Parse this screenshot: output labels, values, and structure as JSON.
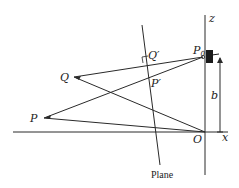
{
  "diagram": {
    "labels": {
      "z_axis": "z",
      "x_axis": "x",
      "origin": "O",
      "camera_point": "P",
      "camera_point_sub": "0",
      "point_q": "Q",
      "point_p": "P",
      "projection_q": "Q′",
      "projection_p": "P′",
      "height": "b",
      "plane": "Plane"
    },
    "colors": {
      "line": "#2a2a2a",
      "camera": "#1a1a1a"
    }
  }
}
